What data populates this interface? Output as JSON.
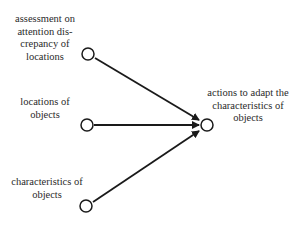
{
  "diagram": {
    "type": "causal-influence",
    "nodes": [
      {
        "id": "assessment",
        "label": "assessment on\nattention dis-\ncrepancy of\nlocations",
        "cx": 88,
        "cy": 54
      },
      {
        "id": "locations",
        "label": "locations of\nobjects",
        "cx": 87,
        "cy": 125
      },
      {
        "id": "characteristics",
        "label": "characteristics of\nobjects",
        "cx": 86,
        "cy": 206
      },
      {
        "id": "actions",
        "label": "actions to adapt the\ncharacteristics of\nobjects",
        "cx": 207,
        "cy": 125
      }
    ],
    "edges": [
      {
        "from": "assessment",
        "to": "actions"
      },
      {
        "from": "locations",
        "to": "actions"
      },
      {
        "from": "characteristics",
        "to": "actions"
      }
    ],
    "colors": {
      "stroke": "#1a1a1a",
      "text": "#2a2a2a",
      "background": "#ffffff"
    }
  }
}
